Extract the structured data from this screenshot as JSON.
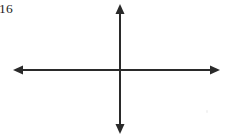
{
  "page": {
    "width": 227,
    "height": 138,
    "background_color": "#ffffff"
  },
  "page_number": {
    "label": "16"
  },
  "figure": {
    "name": "blank-cartesian-axes",
    "caption": "",
    "stroke_color": "#2a2a2a",
    "stroke_width": 2,
    "origin": {
      "x": 120,
      "y": 70
    },
    "x_axis": {
      "label": "",
      "y": 70,
      "x_start": 13,
      "x_end": 220,
      "arrow_start": true,
      "arrow_end": true,
      "tick_labels": []
    },
    "y_axis": {
      "label": "",
      "x": 120,
      "y_start": 4,
      "y_end": 134,
      "arrow_start": true,
      "arrow_end": true,
      "tick_labels": []
    },
    "arrowhead": {
      "length": 10,
      "half_width": 4.5
    }
  },
  "chart_data": {
    "type": "line",
    "title": "",
    "subtitle": "",
    "xlabel": "",
    "ylabel": "",
    "series": [],
    "x": [],
    "categories": [],
    "values": [],
    "xlim": [
      -1,
      1
    ],
    "ylim": [
      -1,
      1
    ],
    "grid": false,
    "legend": null,
    "annotations": []
  }
}
